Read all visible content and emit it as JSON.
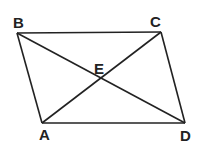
{
  "figure": {
    "type": "parallelogram-with-diagonals",
    "points": {
      "A": {
        "label": "A",
        "x": 42,
        "y": 123,
        "lx": 45,
        "ly": 140
      },
      "B": {
        "label": "B",
        "x": 17,
        "y": 33,
        "lx": 19,
        "ly": 28
      },
      "C": {
        "label": "C",
        "x": 161,
        "y": 32,
        "lx": 156,
        "ly": 27
      },
      "D": {
        "label": "D",
        "x": 185,
        "y": 123,
        "lx": 186,
        "ly": 141
      },
      "E": {
        "label": "E",
        "x": 101,
        "y": 78,
        "lx": 100,
        "ly": 74
      }
    },
    "segments": [
      "BC",
      "CD",
      "DA",
      "AB",
      "AC",
      "BD"
    ],
    "stroke_color": "#222222"
  }
}
